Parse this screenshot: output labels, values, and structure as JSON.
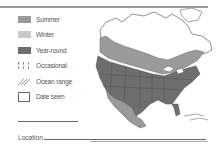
{
  "legend": {
    "items": [
      {
        "label": "Summer",
        "type": "swatch",
        "color": "#9a9a9a"
      },
      {
        "label": "Winter",
        "type": "swatch",
        "color": "#c8c8c8"
      },
      {
        "label": "Year-round",
        "type": "swatch",
        "color": "#6e6e6e"
      },
      {
        "label": "Occasional",
        "type": "dashed"
      },
      {
        "label": "Ocean range",
        "type": "hatch"
      },
      {
        "label": "Date seen",
        "type": "box"
      }
    ]
  },
  "footer": {
    "location_label": "Location"
  },
  "map": {
    "region": "North America",
    "colors": {
      "summer": "#9a9a9a",
      "year_round": "#6e6e6e",
      "land_unshaded": "#ffffff",
      "outline": "#444444"
    }
  }
}
